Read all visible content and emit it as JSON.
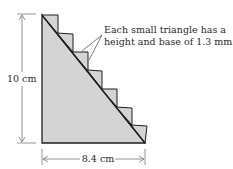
{
  "diagram": {
    "annotation": {
      "line1": "Each small triangle has a",
      "line2": "height and base of 1.3 mm."
    },
    "height_label": "10 cm",
    "base_label": "8.4 cm",
    "colors": {
      "fill": "#d4d4d4",
      "stroke": "#1e1e1e",
      "dimension": "#7a7a7a"
    },
    "small_triangle_count": 7
  }
}
